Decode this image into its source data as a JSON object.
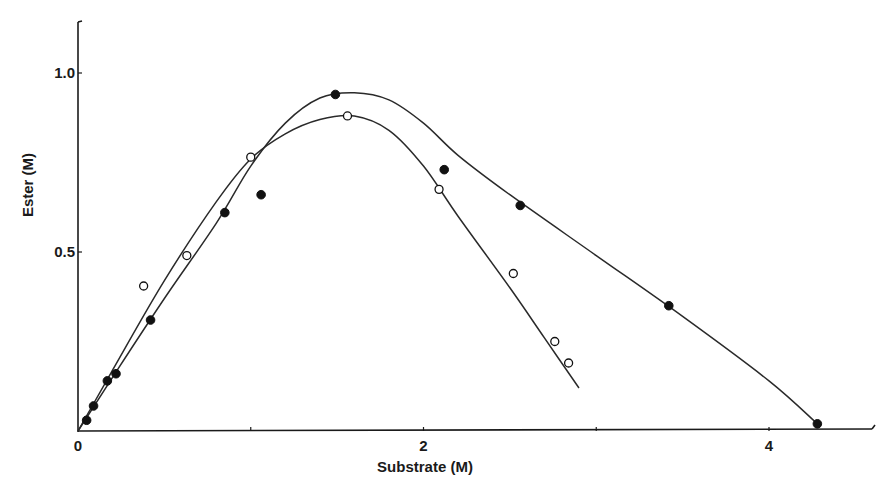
{
  "chart_data": {
    "type": "scatter",
    "title": "",
    "xlabel": "Substrate (M)",
    "ylabel": "Ester (M)",
    "xlim": [
      0,
      4.6
    ],
    "ylim": [
      0,
      1.15
    ],
    "x_ticks": [
      {
        "value": 0,
        "label": "0"
      },
      {
        "value": 1,
        "label": ""
      },
      {
        "value": 2,
        "label": "2"
      },
      {
        "value": 3,
        "label": ""
      },
      {
        "value": 4,
        "label": "4"
      }
    ],
    "y_ticks": [
      {
        "value": 0.5,
        "label": "0.5"
      },
      {
        "value": 1.0,
        "label": "1.0"
      }
    ],
    "grid": false,
    "legend": null,
    "series": [
      {
        "name": "filled circles",
        "marker": "filled-circle",
        "points": [
          {
            "x": 0.05,
            "y": 0.03
          },
          {
            "x": 0.09,
            "y": 0.07
          },
          {
            "x": 0.17,
            "y": 0.14
          },
          {
            "x": 0.22,
            "y": 0.16
          },
          {
            "x": 0.42,
            "y": 0.31
          },
          {
            "x": 0.85,
            "y": 0.61
          },
          {
            "x": 1.06,
            "y": 0.66
          },
          {
            "x": 1.49,
            "y": 0.94
          },
          {
            "x": 2.12,
            "y": 0.73
          },
          {
            "x": 2.56,
            "y": 0.63
          },
          {
            "x": 3.42,
            "y": 0.35
          },
          {
            "x": 4.28,
            "y": 0.02
          }
        ],
        "curve": [
          {
            "x": 0,
            "y": 0
          },
          {
            "x": 0.2,
            "y": 0.15
          },
          {
            "x": 0.5,
            "y": 0.37
          },
          {
            "x": 0.8,
            "y": 0.58
          },
          {
            "x": 1.0,
            "y": 0.74
          },
          {
            "x": 1.2,
            "y": 0.86
          },
          {
            "x": 1.4,
            "y": 0.93
          },
          {
            "x": 1.6,
            "y": 0.945
          },
          {
            "x": 1.8,
            "y": 0.925
          },
          {
            "x": 2.0,
            "y": 0.86
          },
          {
            "x": 2.2,
            "y": 0.77
          },
          {
            "x": 2.5,
            "y": 0.66
          },
          {
            "x": 3.0,
            "y": 0.49
          },
          {
            "x": 3.5,
            "y": 0.32
          },
          {
            "x": 4.0,
            "y": 0.14
          },
          {
            "x": 4.28,
            "y": 0.02
          }
        ]
      },
      {
        "name": "open circles",
        "marker": "open-circle",
        "points": [
          {
            "x": 0.38,
            "y": 0.405
          },
          {
            "x": 0.63,
            "y": 0.49
          },
          {
            "x": 1.0,
            "y": 0.765
          },
          {
            "x": 1.56,
            "y": 0.88
          },
          {
            "x": 2.09,
            "y": 0.675
          },
          {
            "x": 2.52,
            "y": 0.44
          },
          {
            "x": 2.76,
            "y": 0.25
          },
          {
            "x": 2.84,
            "y": 0.19
          }
        ],
        "curve": [
          {
            "x": 0,
            "y": 0
          },
          {
            "x": 0.2,
            "y": 0.17
          },
          {
            "x": 0.5,
            "y": 0.42
          },
          {
            "x": 0.8,
            "y": 0.64
          },
          {
            "x": 1.0,
            "y": 0.76
          },
          {
            "x": 1.2,
            "y": 0.83
          },
          {
            "x": 1.4,
            "y": 0.87
          },
          {
            "x": 1.6,
            "y": 0.88
          },
          {
            "x": 1.8,
            "y": 0.84
          },
          {
            "x": 2.0,
            "y": 0.74
          },
          {
            "x": 2.2,
            "y": 0.6
          },
          {
            "x": 2.5,
            "y": 0.4
          },
          {
            "x": 2.7,
            "y": 0.26
          },
          {
            "x": 2.9,
            "y": 0.12
          }
        ]
      }
    ]
  }
}
